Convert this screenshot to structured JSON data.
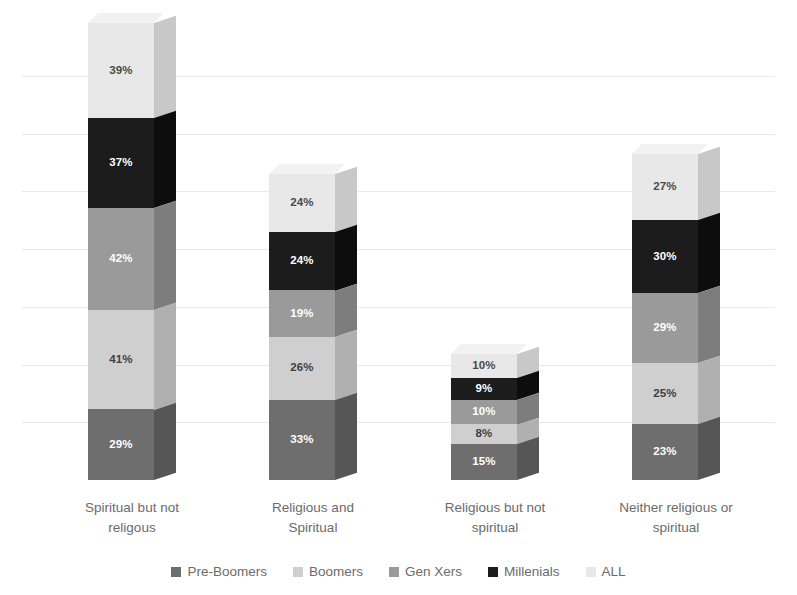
{
  "chart_data": {
    "type": "bar",
    "title": "",
    "subtitle": "",
    "xlabel": "",
    "ylabel": "",
    "stacked": true,
    "three_d": true,
    "grid": true,
    "legend_position": "bottom",
    "value_suffix": "%",
    "ylim": [
      0,
      190
    ],
    "categories": [
      "Spiritual but not religous",
      "Religious and Spiritual",
      "Religious but not spiritual",
      "Neither religious or spiritual"
    ],
    "category_lines": [
      [
        "Spiritual but not",
        "religous"
      ],
      [
        "Religious and",
        "Spiritual"
      ],
      [
        "Religious but not",
        "spiritual"
      ],
      [
        "Neither religious or",
        "spiritual"
      ]
    ],
    "series": [
      {
        "name": "Pre-Boomers",
        "color": "#6e6e6e",
        "side_color": "#565656",
        "top_color": "#888888",
        "label_color": "#ffffff",
        "values": [
          29,
          33,
          15,
          23
        ],
        "labels": [
          "29%",
          "33%",
          "15%",
          "23%"
        ]
      },
      {
        "name": "Boomers",
        "color": "#cfcfcf",
        "side_color": "#b0b0b0",
        "top_color": "#e0e0e0",
        "label_color": "#404040",
        "values": [
          41,
          26,
          8,
          25
        ],
        "labels": [
          "41%",
          "26%",
          "8%",
          "25%"
        ]
      },
      {
        "name": "Gen Xers",
        "color": "#9a9a9a",
        "side_color": "#7d7d7d",
        "top_color": "#b2b2b2",
        "label_color": "#ffffff",
        "values": [
          42,
          19,
          10,
          29
        ],
        "labels": [
          "42%",
          "19%",
          "10%",
          "29%"
        ]
      },
      {
        "name": "Millenials",
        "color": "#1c1c1c",
        "side_color": "#0d0d0d",
        "top_color": "#333333",
        "label_color": "#ffffff",
        "values": [
          37,
          24,
          9,
          30
        ],
        "labels": [
          "37%",
          "24%",
          "9%",
          "30%"
        ]
      },
      {
        "name": "ALL",
        "color": "#e8e8e8",
        "side_color": "#c8c8c8",
        "top_color": "#f2f2f2",
        "label_color": "#4a4a4a",
        "values": [
          39,
          24,
          10,
          27
        ],
        "labels": [
          "39%",
          "24%",
          "10%",
          "27%"
        ]
      }
    ],
    "totals": [
      188,
      126,
      52,
      134
    ],
    "gridline_count": 7
  },
  "legend": {
    "items": [
      {
        "label": "Pre-Boomers",
        "color": "#6e6e6e"
      },
      {
        "label": "Boomers",
        "color": "#cfcfcf"
      },
      {
        "label": "Gen Xers",
        "color": "#9a9a9a"
      },
      {
        "label": "Millenials",
        "color": "#1c1c1c"
      },
      {
        "label": "ALL",
        "color": "#e8e8e8"
      }
    ]
  },
  "theme": {
    "background": "#ffffff",
    "gridline_color": "#e9e9e9",
    "text_color": "#6b6b6b"
  }
}
